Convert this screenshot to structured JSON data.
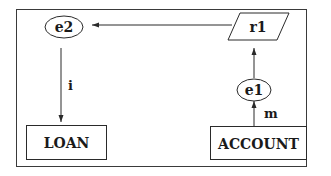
{
  "diagram": {
    "nodes": {
      "e2": {
        "label": "e2",
        "shape": "ellipse"
      },
      "r1": {
        "label": "r1",
        "shape": "parallelogram"
      },
      "e1": {
        "label": "e1",
        "shape": "ellipse"
      },
      "loan": {
        "label": "LOAN",
        "shape": "rectangle"
      },
      "account": {
        "label": "ACCOUNT",
        "shape": "rectangle"
      }
    },
    "edges": [
      {
        "from": "r1",
        "to": "e2",
        "label": ""
      },
      {
        "from": "e2",
        "to": "LOAN",
        "label": "i"
      },
      {
        "from": "e1",
        "to": "r1",
        "label": ""
      },
      {
        "from": "ACCOUNT",
        "to": "e1",
        "label": "m"
      }
    ],
    "edge_labels": {
      "i": "i",
      "m": "m"
    },
    "colors": {
      "stroke": "#2a2a2a",
      "background": "#ffffff"
    }
  }
}
